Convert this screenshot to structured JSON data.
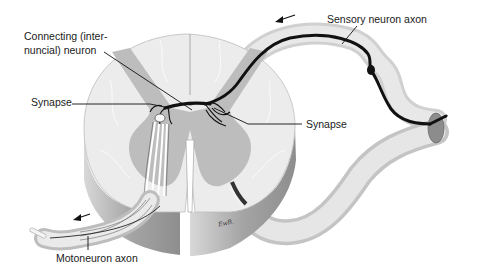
{
  "diagram": {
    "labels": {
      "connecting_neuron_line1": "Connecting (inter-",
      "connecting_neuron_line2": "nuncial) neuron",
      "synapse_left": "Synapse",
      "synapse_right": "Synapse",
      "sensory_axon": "Sensory neuron axon",
      "motoneuron_axon": "Motoneuron axon"
    },
    "signature": "EwB.",
    "arrows": {
      "sensory_direction": "left",
      "motor_direction": "left"
    },
    "colors": {
      "white_matter": "#e9e9e9",
      "gray_matter": "#bdbdbd",
      "cut_side": "#a8a8a8",
      "nerve_root": "#dcdcdc",
      "axon": "#111111",
      "ganglion_cut": "#8a8a8a"
    }
  }
}
